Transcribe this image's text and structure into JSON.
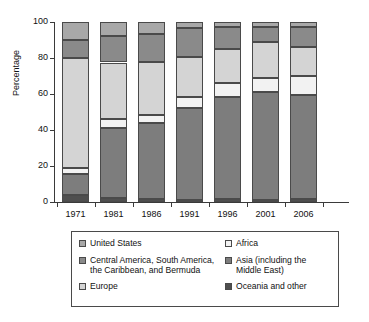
{
  "chart_data": {
    "type": "bar",
    "subtype": "stacked-bar-100",
    "title": "",
    "xlabel": "",
    "ylabel": "Percentage",
    "ylim": [
      0,
      100
    ],
    "yticks": [
      0,
      20,
      40,
      60,
      80,
      100
    ],
    "grid": false,
    "legend_position": "bottom",
    "categories": [
      "1971",
      "1981",
      "1986",
      "1991",
      "1996",
      "2001",
      "2006"
    ],
    "stack_order_bottom_to_top": [
      "Oceania and other",
      "Asia (including the Middle East)",
      "Africa",
      "Europe",
      "Central America, South America, the Caribbean, and Bermuda",
      "United States"
    ],
    "series": [
      {
        "name": "Oceania and other",
        "color": "#4f4f4f",
        "values": [
          4.0,
          2.0,
          1.5,
          1.0,
          1.5,
          1.0,
          1.5
        ]
      },
      {
        "name": "Asia (including the Middle East)",
        "color": "#7d7d7d",
        "values": [
          11.5,
          39.0,
          42.5,
          51.0,
          57.0,
          60.0,
          58.0
        ]
      },
      {
        "name": "Africa",
        "color": "#f2f2f2",
        "values": [
          3.5,
          5.0,
          4.5,
          6.5,
          7.5,
          8.0,
          10.5
        ]
      },
      {
        "name": "Europe",
        "color": "#d4d4d4",
        "values": [
          61.0,
          31.5,
          29.5,
          22.0,
          19.0,
          20.0,
          16.0
        ]
      },
      {
        "name": "Central America, South America, the Caribbean, and Bermuda",
        "color": "#8a8a8a",
        "values": [
          10.0,
          14.5,
          15.5,
          16.0,
          12.0,
          8.5,
          11.0
        ]
      },
      {
        "name": "United States",
        "color": "#a8a8a8",
        "values": [
          10.0,
          8.0,
          6.5,
          3.5,
          3.0,
          2.5,
          3.0
        ]
      }
    ]
  },
  "legend": {
    "left_column": [
      {
        "label": "United States",
        "label_line2": "",
        "color": "#a8a8a8"
      },
      {
        "label": "Central America, South America,",
        "label_line2": "the Caribbean, and Bermuda",
        "color": "#8a8a8a"
      },
      {
        "label": "Europe",
        "label_line2": "",
        "color": "#d4d4d4"
      }
    ],
    "right_column": [
      {
        "label": "Africa",
        "label_line2": "",
        "color": "#f2f2f2"
      },
      {
        "label": "Asia (including the",
        "label_line2": "Middle East)",
        "color": "#7d7d7d"
      },
      {
        "label": "Oceania and other",
        "label_line2": "",
        "color": "#4f4f4f"
      }
    ]
  }
}
